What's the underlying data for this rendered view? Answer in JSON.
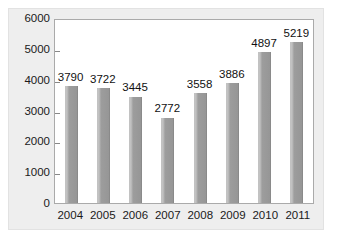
{
  "chart_data": {
    "type": "bar",
    "title": "",
    "xlabel": "",
    "ylabel": "",
    "categories": [
      "2004",
      "2005",
      "2006",
      "2007",
      "2008",
      "2009",
      "2010",
      "2011"
    ],
    "values": [
      3790,
      3722,
      3445,
      2772,
      3558,
      3886,
      4897,
      5219
    ],
    "value_labels": [
      "3790",
      "3722",
      "3445",
      "2772",
      "3558",
      "3886",
      "4897",
      "5219"
    ],
    "ylim": [
      0,
      6000
    ],
    "yticks": [
      0,
      1000,
      2000,
      3000,
      4000,
      5000,
      6000
    ],
    "ytick_labels": [
      "0",
      "1000",
      "2000",
      "3000",
      "4000",
      "5000",
      "6000"
    ],
    "grid": false,
    "legend": false,
    "legend_position": "none",
    "series": [
      {
        "name": "",
        "values": [
          3790,
          3722,
          3445,
          2772,
          3558,
          3886,
          4897,
          5219
        ],
        "color": "#9a9a9a"
      }
    ],
    "colors": {
      "bar": "#9a9a9a",
      "bar_highlight": "#c2c2c2",
      "plot_background": "#ffffff",
      "figure_background": "#eeeeee",
      "axis": "#aaaaaa",
      "text": "#1a1a1a"
    }
  },
  "caption": ""
}
